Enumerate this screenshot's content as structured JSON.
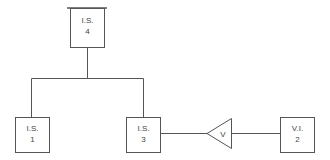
{
  "diagram": {
    "nodes": [
      {
        "id": "is4",
        "line1": "I.S.",
        "line2": "4"
      },
      {
        "id": "is1",
        "line1": "I.S.",
        "line2": "1"
      },
      {
        "id": "is3",
        "line1": "I.S.",
        "line2": "3"
      },
      {
        "id": "vi2",
        "line1": "V.I.",
        "line2": "2"
      }
    ],
    "amplifier": {
      "label": "V"
    },
    "colors": {
      "stroke": "#555555",
      "text": "#444444",
      "background": "#ffffff"
    }
  }
}
